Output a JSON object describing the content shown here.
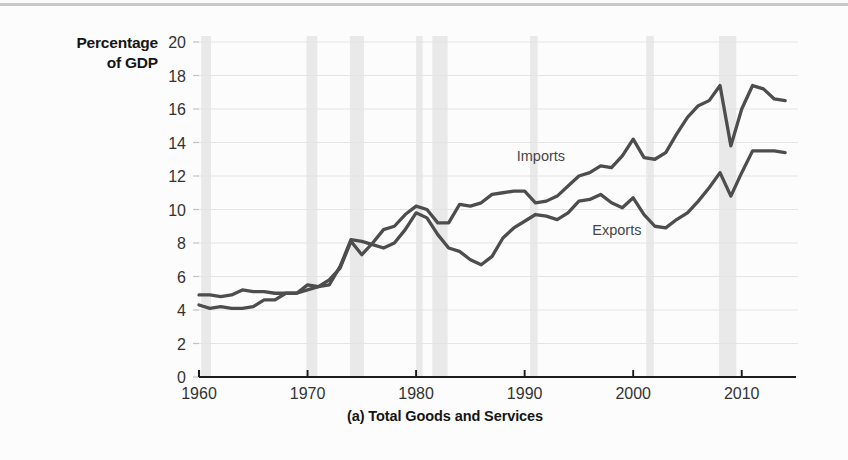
{
  "figure": {
    "y_axis_title_line1": "Percentage",
    "y_axis_title_line2": "of GDP",
    "caption": "(a) Total Goods and Services"
  },
  "chart_data": {
    "type": "line",
    "title": "(a) Total Goods and Services",
    "xlabel": "",
    "ylabel": "Percentage of GDP",
    "xlim": [
      1960,
      2015
    ],
    "ylim": [
      0,
      20
    ],
    "ytick_labels": [
      "0",
      "2",
      "4",
      "6",
      "8",
      "10",
      "12",
      "14",
      "16",
      "18",
      "20"
    ],
    "yticks": [
      0,
      2,
      4,
      6,
      8,
      10,
      12,
      14,
      16,
      18,
      20
    ],
    "xtick_labels": [
      "1960",
      "1970",
      "1980",
      "1990",
      "2000",
      "2010"
    ],
    "xticks": [
      1960,
      1970,
      1980,
      1990,
      2000,
      2010
    ],
    "grid": "horizontal",
    "legend": "inline-annotations",
    "annotations": [
      {
        "text": "Imports",
        "x": 1991.5,
        "y": 12.9
      },
      {
        "text": "Exports",
        "x": 1998.5,
        "y": 8.45
      }
    ],
    "recession_bands": [
      {
        "start": 1960.2,
        "end": 1961.1
      },
      {
        "start": 1969.9,
        "end": 1970.9
      },
      {
        "start": 1973.9,
        "end": 1975.2
      },
      {
        "start": 1980.0,
        "end": 1980.6
      },
      {
        "start": 1981.5,
        "end": 1982.9
      },
      {
        "start": 1990.5,
        "end": 1991.2
      },
      {
        "start": 2001.2,
        "end": 2001.9
      },
      {
        "start": 2007.9,
        "end": 2009.5
      }
    ],
    "recession_band_color": "#e9e9e9",
    "line_color": "#4d4d4d",
    "x": [
      1960,
      1961,
      1962,
      1963,
      1964,
      1965,
      1966,
      1967,
      1968,
      1969,
      1970,
      1971,
      1972,
      1973,
      1974,
      1975,
      1976,
      1977,
      1978,
      1979,
      1980,
      1981,
      1982,
      1983,
      1984,
      1985,
      1986,
      1987,
      1988,
      1989,
      1990,
      1991,
      1992,
      1993,
      1994,
      1995,
      1996,
      1997,
      1998,
      1999,
      2000,
      2001,
      2002,
      2003,
      2004,
      2005,
      2006,
      2007,
      2008,
      2009,
      2010,
      2011,
      2012,
      2013,
      2014
    ],
    "series": [
      {
        "name": "Exports",
        "values": [
          4.9,
          4.9,
          4.8,
          4.9,
          5.2,
          5.1,
          5.1,
          5.0,
          5.0,
          5.0,
          5.5,
          5.4,
          5.5,
          6.6,
          8.2,
          8.1,
          7.9,
          7.7,
          8.0,
          8.8,
          9.8,
          9.5,
          8.5,
          7.7,
          7.5,
          7.0,
          6.7,
          7.2,
          8.3,
          8.9,
          9.3,
          9.7,
          9.6,
          9.4,
          9.8,
          10.5,
          10.6,
          10.9,
          10.4,
          10.1,
          10.7,
          9.7,
          9.0,
          8.9,
          9.4,
          9.8,
          10.5,
          11.3,
          12.2,
          10.8,
          12.2,
          13.5,
          13.5,
          13.5,
          13.4
        ]
      },
      {
        "name": "Imports",
        "values": [
          4.3,
          4.1,
          4.2,
          4.1,
          4.1,
          4.2,
          4.6,
          4.6,
          5.0,
          5.0,
          5.2,
          5.4,
          5.8,
          6.5,
          8.1,
          7.3,
          8.0,
          8.8,
          9.0,
          9.7,
          10.2,
          10.0,
          9.2,
          9.2,
          10.3,
          10.2,
          10.4,
          10.9,
          11.0,
          11.1,
          11.1,
          10.4,
          10.5,
          10.8,
          11.4,
          12.0,
          12.2,
          12.6,
          12.5,
          13.2,
          14.2,
          13.1,
          13.0,
          13.4,
          14.5,
          15.5,
          16.2,
          16.5,
          17.4,
          13.8,
          16.0,
          17.4,
          17.2,
          16.6,
          16.5
        ]
      }
    ]
  }
}
